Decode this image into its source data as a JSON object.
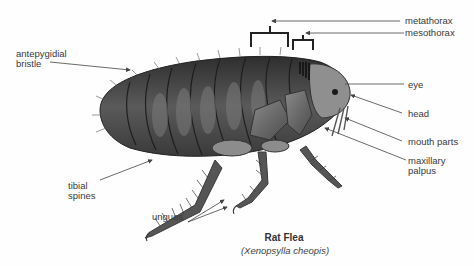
{
  "diagram": {
    "title": "Rat Flea",
    "subtitle": "(Xenopsylla cheopis)",
    "labels": {
      "antepygidial_bristle": "antepygidial\nbristle",
      "metathorax": "metathorax",
      "mesothorax": "mesothorax",
      "eye": "eye",
      "head": "head",
      "mouth_parts": "mouth parts",
      "maxillary_palpus": "maxillary\npalpus",
      "tibial_spines": "tibial\nspines",
      "ungues": "ungues"
    },
    "colors": {
      "body_dark": "#3d3d3d",
      "body_mid": "#6e6e6e",
      "body_light": "#a8a8a8",
      "leader_line": "#444444",
      "text": "#3a3a3a"
    }
  }
}
